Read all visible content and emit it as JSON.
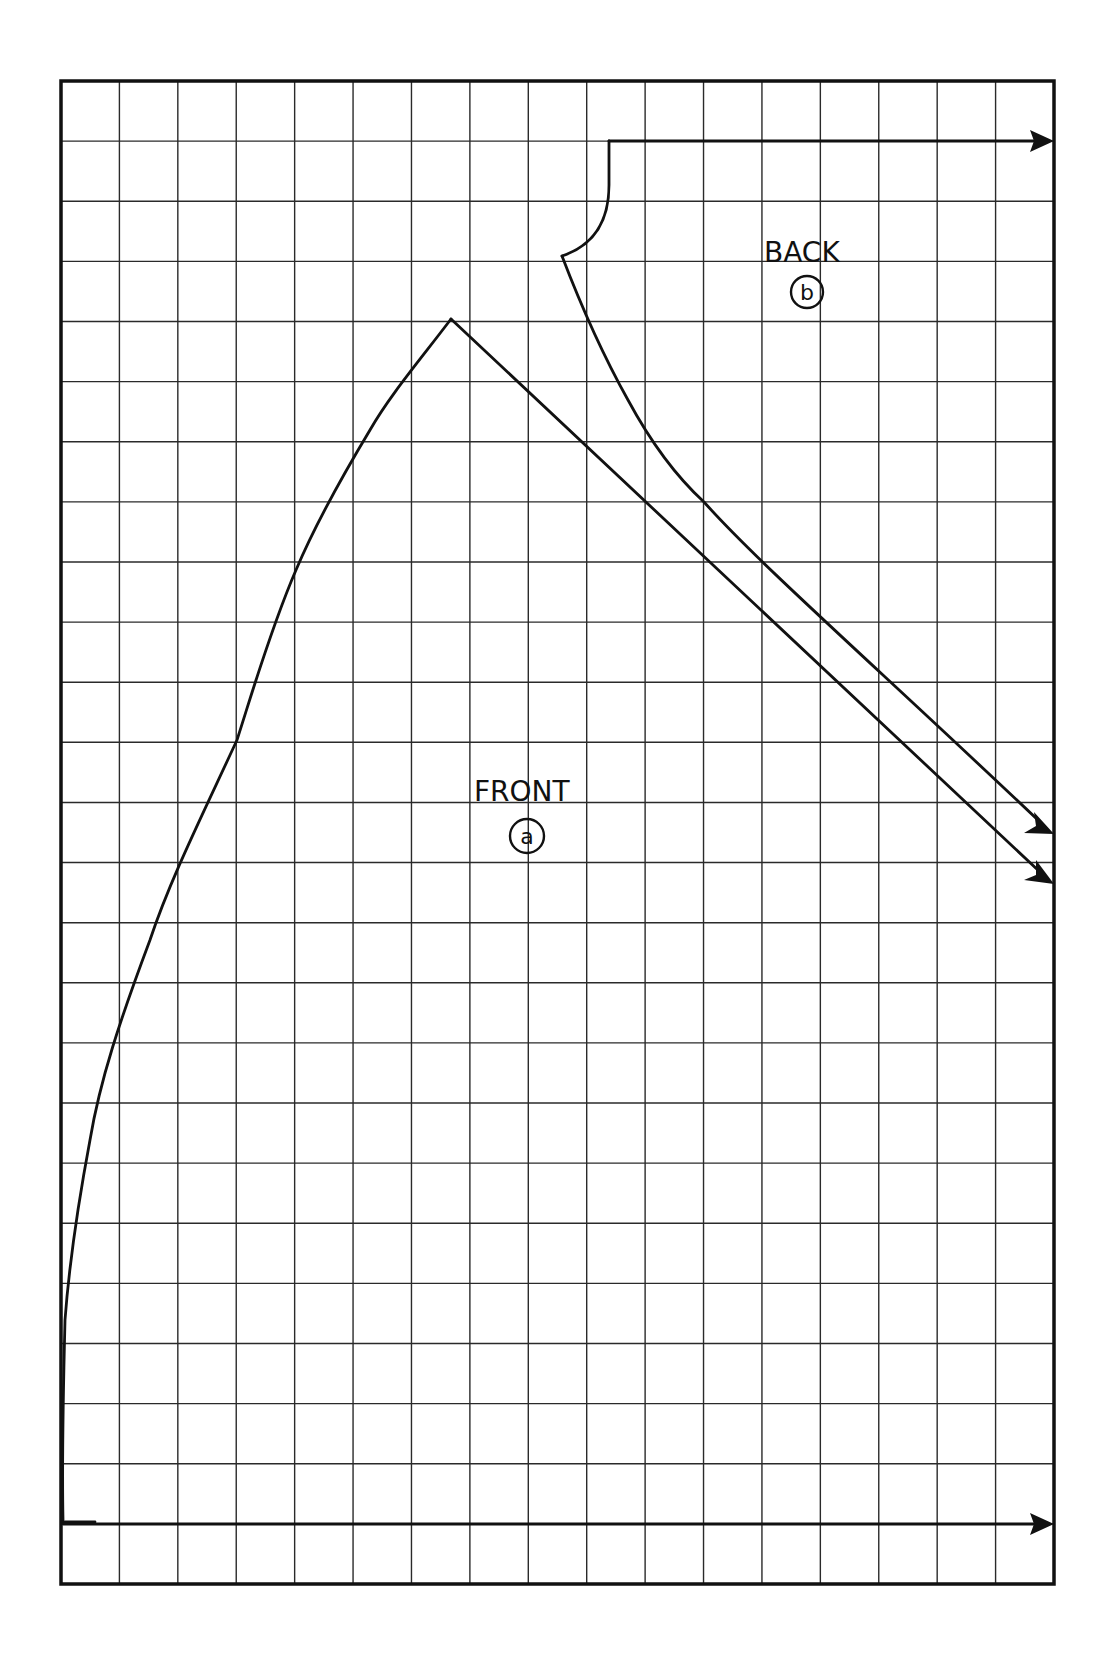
{
  "diagram": {
    "type": "sewing-pattern-grid",
    "grid": {
      "columns": 17,
      "rows": 25,
      "line_color": "#2a2a2a",
      "background": "#ffffff"
    },
    "pieces": [
      {
        "id": "front",
        "label": "FRONT",
        "badge": "a"
      },
      {
        "id": "back",
        "label": "BACK",
        "badge": "b"
      }
    ],
    "arrows": [
      {
        "id": "top-arrow",
        "description": "horizontal arrow from back neckline to right edge"
      },
      {
        "id": "upper-diagonal-arrow",
        "description": "back shoulder/side line arrow to right edge"
      },
      {
        "id": "lower-diagonal-arrow",
        "description": "front shoulder line arrow to right edge"
      },
      {
        "id": "bottom-arrow",
        "description": "horizontal hem arrow to right edge"
      }
    ]
  },
  "labels": {
    "front": "FRONT",
    "front_badge": "a",
    "back": "BACK",
    "back_badge": "b"
  }
}
